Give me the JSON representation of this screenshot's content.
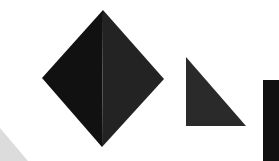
{
  "canvas": {
    "width": 279,
    "height": 161,
    "background": "#ffffff"
  },
  "shapes": {
    "diamond": {
      "label": "diamond",
      "left_half_color": "#111111",
      "right_half_color": "#232323",
      "points": {
        "top": [
          103,
          10
        ],
        "left": [
          42,
          78
        ],
        "right": [
          164,
          79
        ],
        "bottom": [
          102,
          147
        ]
      }
    },
    "triangle": {
      "label": "right triangle",
      "color": "#2a2a2a",
      "points": [
        [
          186,
          57
        ],
        [
          186,
          126
        ],
        [
          246,
          126
        ]
      ]
    },
    "rectangle": {
      "label": "rectangle",
      "color": "#111111",
      "x": 263,
      "y": 80,
      "width": 16,
      "height": 81
    },
    "corner_wedge": {
      "label": "light gray wedge",
      "color": "#dcdcdc",
      "points": [
        [
          0,
          128
        ],
        [
          28,
          161
        ],
        [
          0,
          161
        ]
      ]
    }
  }
}
